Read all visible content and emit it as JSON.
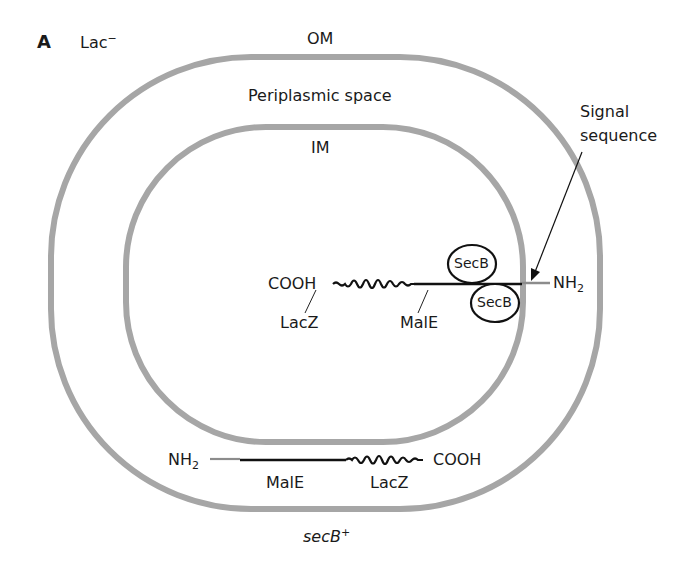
{
  "panel": {
    "letter": "A",
    "phenotype": "Lac",
    "phenotype_sup": "−"
  },
  "compartments": {
    "outer_membrane": "OM",
    "periplasm": "Periplasmic space",
    "inner_membrane": "IM"
  },
  "signal_label": {
    "line1": "Signal",
    "line2": "sequence"
  },
  "cytoplasmic_fusion": {
    "c_terminus": "COOH",
    "n_terminus": "NH",
    "n_terminus_sub": "2",
    "lacz_label": "LacZ",
    "male_label": "MalE",
    "chaperone_1": "SecB",
    "chaperone_2": "SecB"
  },
  "periplasmic_fusion": {
    "n_terminus": "NH",
    "n_terminus_sub": "2",
    "c_terminus": "COOH",
    "male_label": "MalE",
    "lacz_label": "LacZ"
  },
  "genotype": {
    "gene": "secB",
    "sup": "+"
  },
  "colors": {
    "membrane": "#a6a6a6",
    "protein": "#111111",
    "signal": "#8c8c8c"
  }
}
